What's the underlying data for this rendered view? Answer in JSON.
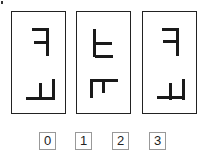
{
  "figure": {
    "panels": [
      {
        "id": 1,
        "left": 11,
        "glyphs": [
          {
            "name": "mirrored-f-glyph",
            "strokes": [
              [
                20,
                16,
                16,
                3
              ],
              [
                34,
                16,
                3,
                28
              ],
              [
                22,
                29,
                13,
                3
              ]
            ]
          },
          {
            "name": "mirrored-l-shelf-glyph",
            "strokes": [
              [
                14,
                85,
                29,
                3
              ],
              [
                40,
                67,
                3,
                21
              ],
              [
                27,
                71,
                3,
                17
              ]
            ]
          }
        ]
      },
      {
        "id": 2,
        "left": 76,
        "glyphs": [
          {
            "name": "rotated-e-glyph",
            "strokes": [
              [
                16,
                17,
                3,
                28
              ],
              [
                18,
                30,
                17,
                3
              ],
              [
                18,
                43,
                18,
                3
              ]
            ]
          },
          {
            "name": "pi-shaped-glyph",
            "strokes": [
              [
                13,
                67,
                28,
                3
              ],
              [
                13,
                67,
                3,
                19
              ],
              [
                25,
                67,
                3,
                14
              ]
            ]
          }
        ]
      },
      {
        "id": 3,
        "left": 142,
        "glyphs": [
          {
            "name": "mirrored-f-glyph",
            "strokes": [
              [
                19,
                16,
                16,
                3
              ],
              [
                33,
                16,
                3,
                28
              ],
              [
                20,
                28,
                13,
                3
              ]
            ]
          },
          {
            "name": "mirrored-l-shelf-glyph",
            "strokes": [
              [
                14,
                84,
                28,
                3
              ],
              [
                39,
                67,
                3,
                21
              ],
              [
                26,
                71,
                3,
                17
              ]
            ]
          }
        ]
      }
    ],
    "options": [
      {
        "label": "0",
        "left": 39
      },
      {
        "label": "1",
        "left": 75
      },
      {
        "label": "2",
        "left": 112
      },
      {
        "label": "3",
        "left": 149
      }
    ]
  }
}
